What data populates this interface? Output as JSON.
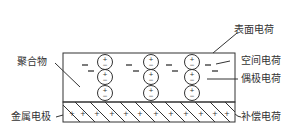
{
  "diagram": {
    "type": "electret-charge-distribution",
    "labels": {
      "polymer": "聚合物",
      "metal_electrode": "金属电极",
      "surface_charge": "表面电荷",
      "space_charge": "空间电荷",
      "dipole_charge": "偶极电荷",
      "compensation_charge": "补偿电荷"
    },
    "symbols": {
      "dipole_top": "+",
      "dipole_bottom": "−",
      "space_charge": "−",
      "compensation": "+"
    },
    "colors": {
      "line": "#333333",
      "background": "#ffffff"
    }
  }
}
